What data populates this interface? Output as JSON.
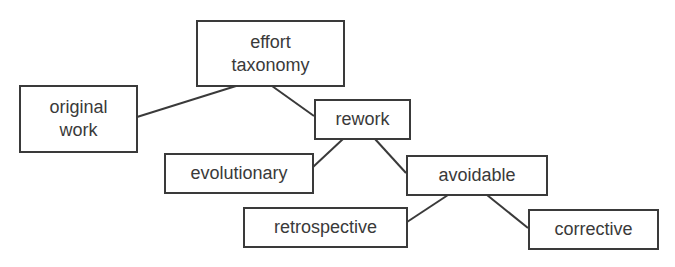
{
  "diagram": {
    "type": "tree",
    "colors": {
      "stroke": "#3a3a3a",
      "text": "#3a3a3a",
      "background": "#ffffff"
    },
    "nodes": [
      {
        "id": "effort_taxonomy",
        "line1": "effort",
        "line2": "taxonomy"
      },
      {
        "id": "original_work",
        "line1": "original",
        "line2": "work"
      },
      {
        "id": "rework",
        "label": "rework"
      },
      {
        "id": "evolutionary",
        "label": "evolutionary"
      },
      {
        "id": "avoidable",
        "label": "avoidable"
      },
      {
        "id": "retrospective",
        "label": "retrospective"
      },
      {
        "id": "corrective",
        "label": "corrective"
      }
    ],
    "edges": [
      {
        "from": "effort_taxonomy",
        "to": "original_work"
      },
      {
        "from": "effort_taxonomy",
        "to": "rework"
      },
      {
        "from": "rework",
        "to": "evolutionary"
      },
      {
        "from": "rework",
        "to": "avoidable"
      },
      {
        "from": "avoidable",
        "to": "retrospective"
      },
      {
        "from": "avoidable",
        "to": "corrective"
      }
    ]
  }
}
